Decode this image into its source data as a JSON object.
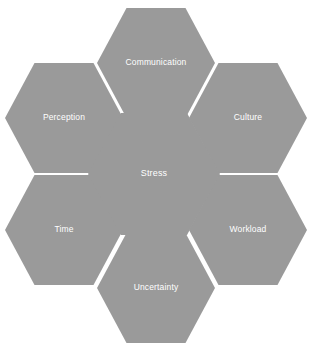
{
  "diagram": {
    "type": "hexagon-honeycomb",
    "background_color": "#ffffff",
    "hex_fill_color": "#9a9a9a",
    "hex_label_color": "#ffffff",
    "center_node": {
      "id": "stress",
      "label": "Stress",
      "cx": 154,
      "cy": 174,
      "width": 132,
      "height": 122
    },
    "satellite_nodes": [
      {
        "id": "communication",
        "label": "Communication",
        "position": "top",
        "cx": 156,
        "cy": 63,
        "width": 118,
        "height": 110
      },
      {
        "id": "perception",
        "label": "Perception",
        "position": "upper-left",
        "cx": 64,
        "cy": 118,
        "width": 118,
        "height": 110
      },
      {
        "id": "culture",
        "label": "Culture",
        "position": "upper-right",
        "cx": 248,
        "cy": 118,
        "width": 118,
        "height": 110
      },
      {
        "id": "time",
        "label": "Time",
        "position": "lower-left",
        "cx": 64,
        "cy": 230,
        "width": 118,
        "height": 110
      },
      {
        "id": "workload",
        "label": "Workload",
        "position": "lower-right",
        "cx": 248,
        "cy": 230,
        "width": 118,
        "height": 110
      },
      {
        "id": "uncertainty",
        "label": "Uncertainty",
        "position": "bottom",
        "cx": 156,
        "cy": 288,
        "width": 118,
        "height": 110
      }
    ]
  }
}
